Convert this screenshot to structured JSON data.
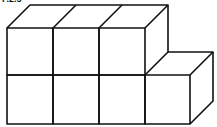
{
  "figure": {
    "label": "F.2.5",
    "stroke_color": "#111111",
    "background": "#ffffff",
    "cubes": {
      "top_row": 3,
      "bottom_row": 4,
      "total": 7
    }
  }
}
